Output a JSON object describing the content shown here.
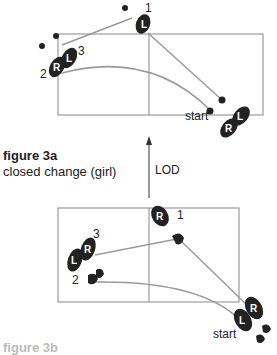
{
  "figure_a": {
    "title": "figure 3a",
    "subtitle": "closed change (girl)",
    "start_label": "start",
    "step_labels": [
      "1",
      "2",
      "3"
    ],
    "foot_letters": {
      "left": "L",
      "right": "R"
    }
  },
  "lod_label": "LOD",
  "figure_b": {
    "start_label": "start",
    "step_labels": [
      "1",
      "2",
      "3"
    ],
    "foot_letters": {
      "left": "L",
      "right": "R"
    },
    "title_partial": "figure 3b"
  },
  "colors": {
    "line": "#9a9a9a",
    "foot": "#222222",
    "box": "#888888"
  }
}
